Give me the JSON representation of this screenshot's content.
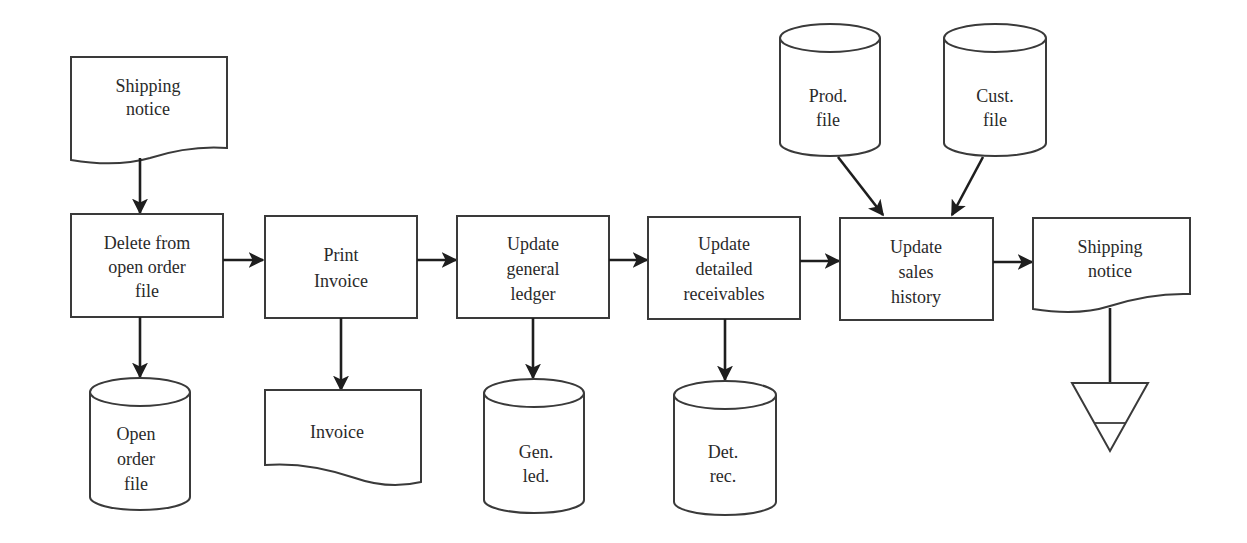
{
  "diagram": {
    "type": "system flowchart",
    "input_document": {
      "lines": [
        "Shipping",
        "notice"
      ]
    },
    "processes": [
      {
        "id": "p1",
        "lines": [
          "Delete from",
          "open order",
          "file"
        ]
      },
      {
        "id": "p2",
        "lines": [
          "Print",
          "Invoice"
        ]
      },
      {
        "id": "p3",
        "lines": [
          "Update",
          "general",
          "ledger"
        ]
      },
      {
        "id": "p4",
        "lines": [
          "Update",
          "detailed",
          "receivables"
        ]
      },
      {
        "id": "p5",
        "lines": [
          "Update",
          "sales",
          "history"
        ]
      }
    ],
    "outputs": {
      "open_order_file": {
        "shape": "disk-storage",
        "lines": [
          "Open",
          "order",
          "file"
        ]
      },
      "invoice": {
        "shape": "document",
        "lines": [
          "Invoice"
        ]
      },
      "gen_led": {
        "shape": "disk-storage",
        "lines": [
          "Gen.",
          "led."
        ]
      },
      "det_rec": {
        "shape": "disk-storage",
        "lines": [
          "Det.",
          "rec."
        ]
      },
      "shipping_notice_out": {
        "shape": "document",
        "lines": [
          "Shipping",
          "notice"
        ]
      },
      "offline_file": {
        "shape": "offline-storage-triangle"
      }
    },
    "inputs_to_p5": [
      {
        "shape": "disk-storage",
        "lines": [
          "Prod.",
          "file"
        ]
      },
      {
        "shape": "disk-storage",
        "lines": [
          "Cust.",
          "file"
        ]
      }
    ],
    "colors": {
      "stroke": "#3a3a3a",
      "arrow": "#1e1e1e",
      "text": "#2a2a2a",
      "background": "#ffffff"
    }
  }
}
